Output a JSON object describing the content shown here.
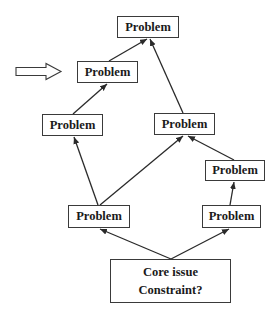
{
  "diagram": {
    "type": "cause-effect tree",
    "pointer_arrow": {
      "direction": "right",
      "target": "n2"
    },
    "nodes": [
      {
        "id": "n1",
        "label": "Problem",
        "x": 117,
        "y": 16,
        "w": 62,
        "h": 22
      },
      {
        "id": "n2",
        "label": "Problem",
        "x": 77,
        "y": 61,
        "w": 61,
        "h": 22
      },
      {
        "id": "n3",
        "label": "Problem",
        "x": 42,
        "y": 114,
        "w": 61,
        "h": 22
      },
      {
        "id": "n4",
        "label": "Problem",
        "x": 154,
        "y": 113,
        "w": 61,
        "h": 22
      },
      {
        "id": "n5",
        "label": "Problem",
        "x": 205,
        "y": 160,
        "w": 60,
        "h": 21
      },
      {
        "id": "n6",
        "label": "Problem",
        "x": 68,
        "y": 205,
        "w": 62,
        "h": 23
      },
      {
        "id": "n7",
        "label": "Problem",
        "x": 202,
        "y": 205,
        "w": 59,
        "h": 23
      }
    ],
    "core": {
      "id": "core",
      "line1": "Core issue",
      "line2": "Constraint?",
      "x": 110,
      "y": 259,
      "w": 121,
      "h": 44
    },
    "edges": [
      {
        "from": "core",
        "to": "n6"
      },
      {
        "from": "core",
        "to": "n7"
      },
      {
        "from": "n6",
        "to": "n3"
      },
      {
        "from": "n6",
        "to": "n4"
      },
      {
        "from": "n7",
        "to": "n5"
      },
      {
        "from": "n5",
        "to": "n4"
      },
      {
        "from": "n3",
        "to": "n2"
      },
      {
        "from": "n2",
        "to": "n1"
      },
      {
        "from": "n4",
        "to": "n1"
      }
    ]
  }
}
